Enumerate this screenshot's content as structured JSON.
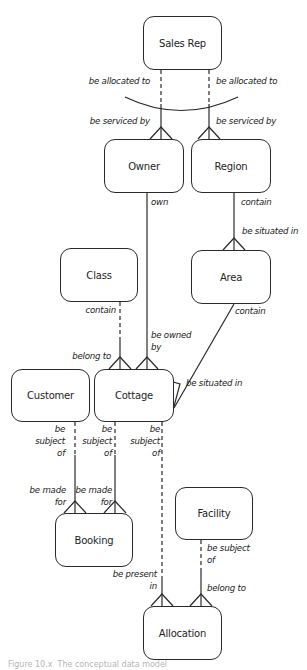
{
  "diagram": {
    "type": "entity-relationship",
    "entities": [
      {
        "id": "sales_rep",
        "label": "Sales Rep"
      },
      {
        "id": "owner",
        "label": "Owner"
      },
      {
        "id": "region",
        "label": "Region"
      },
      {
        "id": "class",
        "label": "Class"
      },
      {
        "id": "area",
        "label": "Area"
      },
      {
        "id": "customer",
        "label": "Customer"
      },
      {
        "id": "cottage",
        "label": "Cottage"
      },
      {
        "id": "booking",
        "label": "Booking"
      },
      {
        "id": "facility",
        "label": "Facility"
      },
      {
        "id": "allocation",
        "label": "Allocation"
      }
    ],
    "relationships": [
      {
        "from": "sales_rep",
        "to": "owner",
        "from_label": "be allocated to",
        "to_label": "be serviced by",
        "exclusive_arc": true
      },
      {
        "from": "sales_rep",
        "to": "region",
        "from_label": "be allocated to",
        "to_label": "be serviced by",
        "exclusive_arc": true
      },
      {
        "from": "owner",
        "to": "cottage",
        "from_label": "own",
        "to_label": "be owned\nby"
      },
      {
        "from": "region",
        "to": "area",
        "from_label": "contain",
        "to_label": "be situated in"
      },
      {
        "from": "class",
        "to": "cottage",
        "from_label": "contain",
        "to_label": "belong to"
      },
      {
        "from": "area",
        "to": "cottage",
        "from_label": "contain",
        "to_label": "be situated in"
      },
      {
        "from": "customer",
        "to": "booking",
        "from_label": "be\nsubject\nof",
        "to_label": "be made\nfor"
      },
      {
        "from": "cottage",
        "to": "booking",
        "from_label": "be\nsubject\nof",
        "to_label": "be made\nfor"
      },
      {
        "from": "cottage",
        "to": "allocation",
        "from_label": "be\nsubject\nof",
        "to_label": "be present\nin"
      },
      {
        "from": "facility",
        "to": "allocation",
        "from_label": "be subject\nof",
        "to_label": "belong to"
      }
    ],
    "caption": "Figure 10.x  The conceptual data model"
  },
  "labels": {
    "sr_owner_from": "be allocated to",
    "sr_region_from": "be allocated to",
    "sr_owner_to": "be serviced by",
    "sr_region_to": "be serviced by",
    "owner_own": "own",
    "region_contain": "contain",
    "area_situated": "be situated in",
    "class_contain": "contain",
    "area_contain": "contain",
    "cottage_owned_by": "be owned\nby",
    "cottage_belong_to": "belong to",
    "cottage_situated": "be situated in",
    "customer_subject": "be\nsubject\nof",
    "cottage_subject_1": "be\nsubject\nof",
    "cottage_subject_2": "be\nsubject\nof",
    "booking_made_for_1": "be made\nfor",
    "booking_made_for_2": "be made\nfor",
    "facility_subject": "be subject\nof",
    "allocation_present_in": "be present\nin",
    "allocation_belong_to": "belong to"
  }
}
